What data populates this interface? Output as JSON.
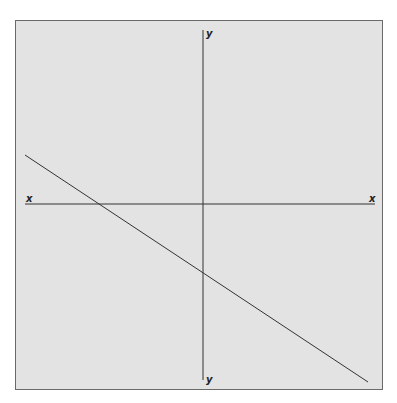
{
  "diagram": {
    "type": "cartesian-line-graph",
    "axes": {
      "x_label_left": "x",
      "x_label_right": "x",
      "y_label_top": "y",
      "y_label_bottom": "y"
    },
    "line": {
      "description": "straight line with negative slope and negative y-intercept",
      "slope_sign": "negative",
      "x_intercept_side": "negative",
      "y_intercept_side": "negative"
    },
    "colors": {
      "background": "#e3e3e3",
      "frame": "#6a6a6a",
      "axis": "#333333",
      "line": "#333333"
    }
  }
}
